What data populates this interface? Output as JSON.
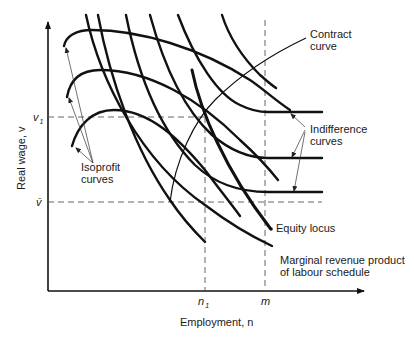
{
  "diagram": {
    "axes": {
      "x_label": "Employment, n",
      "y_label": "Real wage, v",
      "x_ticks": [
        {
          "label": "n",
          "subscript": "1"
        },
        {
          "label": "m",
          "subscript": ""
        }
      ],
      "y_ticks": [
        {
          "label": "v",
          "subscript": "1"
        },
        {
          "label": "v̄",
          "subscript": ""
        }
      ]
    },
    "annotations": {
      "contract_curve": [
        "Contract",
        "curve"
      ],
      "indifference_curves": [
        "Indifference",
        "curves"
      ],
      "isoprofit_curves": [
        "Isoprofit",
        "curves"
      ],
      "equity_locus": "Equity locus",
      "mrpl": [
        "Marginal revenue product",
        "of labour schedule"
      ]
    },
    "curve_counts": {
      "isoprofit_curves": 3,
      "indifference_curves": 3
    }
  }
}
